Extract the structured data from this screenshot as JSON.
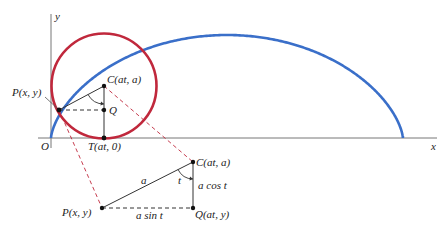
{
  "figure": {
    "type": "cycloid-construction",
    "axes": {
      "x_label": "x",
      "y_label": "y",
      "origin_label": "O"
    },
    "colors": {
      "cycloid": "#3a6fc9",
      "circle": "#c0283c",
      "dashed_connector": "#c0283c",
      "construction": "#333333"
    },
    "upper": {
      "P_label": "P(x, y)",
      "C_label": "C(at, a)",
      "Q_label": "Q",
      "T_label": "T(at, 0)"
    },
    "lower": {
      "C_label": "C(at, a)",
      "P_label": "P(x, y)",
      "Q_label": "Q(at, y)",
      "hyp_label": "a",
      "angle_label": "t",
      "vert_label": "a cos t",
      "horiz_label": "a sin t"
    }
  }
}
